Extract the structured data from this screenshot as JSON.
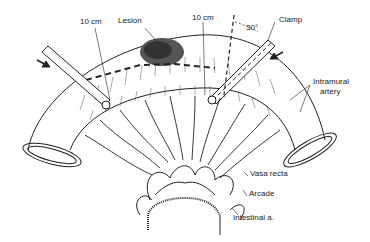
{
  "diagram": {
    "type": "anatomical-illustration",
    "labels": {
      "margin_left": "10 cm",
      "lesion": "Lesion",
      "margin_right": "10 cm",
      "angle": "30°",
      "clamp": "Clamp",
      "intramural_artery": "Intramural\nartery",
      "intramural_line1": "Intramural",
      "intramural_line2": "artery",
      "vasa_recta": "Vasa recta",
      "arcade": "Arcade",
      "intestinal_artery": "Intestinal a."
    },
    "colors": {
      "line": "#222222",
      "background": "#ffffff",
      "lesion": "#444444"
    }
  }
}
